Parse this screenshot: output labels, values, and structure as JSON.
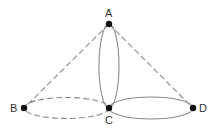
{
  "diagram": {
    "type": "graph",
    "nodes": [
      {
        "id": "A",
        "label": "A",
        "x": 109,
        "y": 24,
        "label_x": 105,
        "label_y": 15
      },
      {
        "id": "B",
        "label": "B",
        "x": 24,
        "y": 108,
        "label_x": 10,
        "label_y": 112
      },
      {
        "id": "C",
        "label": "C",
        "x": 109,
        "y": 108,
        "label_x": 105,
        "label_y": 124
      },
      {
        "id": "D",
        "label": "D",
        "x": 193,
        "y": 108,
        "label_x": 199,
        "label_y": 112
      }
    ],
    "edges": [
      {
        "from": "A",
        "to": "B",
        "style": "dashed",
        "shape": "line"
      },
      {
        "from": "A",
        "to": "D",
        "style": "dashed",
        "shape": "line"
      },
      {
        "from": "A",
        "to": "C",
        "style": "solid",
        "shape": "ellipse-loop"
      },
      {
        "from": "B",
        "to": "C",
        "style": "dashed",
        "shape": "ellipse-loop"
      },
      {
        "from": "C",
        "to": "D",
        "style": "solid",
        "shape": "ellipse-loop"
      }
    ],
    "colors": {
      "stroke": "#8a8a8a",
      "node": "#111111",
      "label": "#333333"
    }
  }
}
